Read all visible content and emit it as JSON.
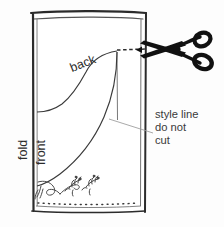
{
  "diagram": {
    "labels": {
      "back": "back",
      "fold": "fold",
      "front": "front"
    },
    "note": {
      "line1": "style line",
      "line2": "do not",
      "line3": "cut"
    },
    "icons": {
      "scissors": "scissors-icon",
      "flower_left": "floral-sprig-icon",
      "flower_right": "floral-sprig-icon",
      "swirl": "embroidery-swirl-icon"
    },
    "colors": {
      "ink": "#2b2b2b",
      "scissors": "#111111",
      "paper": "#fdfdfd",
      "leader": "#8a8a8a",
      "note_text": "#3a3a3a"
    },
    "elements": {
      "fabric_outline": "fabric-rectangle-outline",
      "fold_edge": "left-fold-edge",
      "cut_dash": "dashed-cut-line",
      "hem_dots": "dotted-hem-stitch-line",
      "style_curve": "style-line-curve",
      "back_curve": "back-neckline-curve",
      "leader_line": "style-line-leader"
    }
  }
}
